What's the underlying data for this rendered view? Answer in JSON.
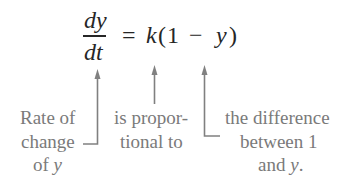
{
  "diagram": {
    "equation": {
      "numerator": "dy",
      "denominator": "dt",
      "equals": "=",
      "k": "k",
      "open_paren": "(",
      "one": "1",
      "minus": "−",
      "y": "y",
      "close_paren": ")"
    },
    "annotations": [
      {
        "target": "dy/dt",
        "lines": [
          "Rate of",
          "change",
          "of y"
        ],
        "y_variable": "y"
      },
      {
        "target": "k",
        "lines": [
          "is propor-",
          "tional to"
        ]
      },
      {
        "target": "(1 − y)",
        "lines": [
          "the difference",
          "between 1",
          "and y."
        ],
        "y_variable": "y"
      }
    ],
    "colors": {
      "equation_text": "#262626",
      "label_text": "#7a7a7a",
      "arrow": "#808080",
      "background": "#ffffff"
    }
  }
}
